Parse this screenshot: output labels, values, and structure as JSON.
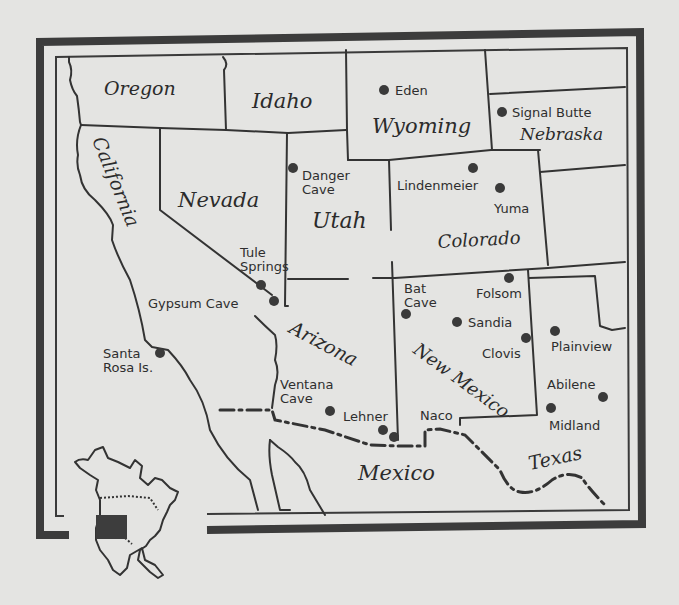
{
  "map": {
    "title": "",
    "states": [
      {
        "name": "Oregon",
        "x": 104,
        "y": 95,
        "size": 19,
        "rotate": 0
      },
      {
        "name": "Idaho",
        "x": 252,
        "y": 108,
        "size": 21,
        "rotate": 0
      },
      {
        "name": "Wyoming",
        "x": 372,
        "y": 133,
        "size": 21,
        "rotate": 0
      },
      {
        "name": "Nebraska",
        "x": 520,
        "y": 140,
        "size": 17,
        "rotate": 0
      },
      {
        "name": "California",
        "x": 92,
        "y": 140,
        "size": 19,
        "rotate": 68
      },
      {
        "name": "Nevada",
        "x": 178,
        "y": 207,
        "size": 21,
        "rotate": 0
      },
      {
        "name": "Utah",
        "x": 312,
        "y": 228,
        "size": 22,
        "rotate": 0
      },
      {
        "name": "Colorado",
        "x": 438,
        "y": 248,
        "size": 18,
        "rotate": -3
      },
      {
        "name": "Arizona",
        "x": 288,
        "y": 332,
        "size": 19,
        "rotate": 28
      },
      {
        "name": "New Mexico",
        "x": 412,
        "y": 352,
        "size": 18,
        "rotate": 36
      },
      {
        "name": "Mexico",
        "x": 358,
        "y": 480,
        "size": 21,
        "rotate": 0
      },
      {
        "name": "Texas",
        "x": 530,
        "y": 470,
        "size": 19,
        "rotate": -12
      }
    ],
    "sites": [
      {
        "name": "Eden",
        "dot": [
          384,
          90
        ],
        "label_lines": [
          "Eden"
        ],
        "lx": 395,
        "ly": 95
      },
      {
        "name": "Signal Butte",
        "dot": [
          502,
          112
        ],
        "label_lines": [
          "Signal Butte"
        ],
        "lx": 512,
        "ly": 117
      },
      {
        "name": "Danger Cave",
        "dot": [
          293,
          168
        ],
        "label_lines": [
          "Danger",
          "Cave"
        ],
        "lx": 302,
        "ly": 180
      },
      {
        "name": "Lindenmeier",
        "dot": [
          473,
          168
        ],
        "label_lines": [
          "Lindenmeier"
        ],
        "lx": 397,
        "ly": 190
      },
      {
        "name": "Yuma",
        "dot": [
          500,
          188
        ],
        "label_lines": [
          "Yuma"
        ],
        "lx": 494,
        "ly": 213
      },
      {
        "name": "Tule Springs",
        "dot": [
          261,
          285
        ],
        "label_lines": [
          "Tule",
          "Springs"
        ],
        "lx": 240,
        "ly": 257
      },
      {
        "name": "Gypsum Cave",
        "dot": [
          274,
          301
        ],
        "label_lines": [
          "Gypsum Cave"
        ],
        "lx": 148,
        "ly": 308
      },
      {
        "name": "Santa Rosa Is.",
        "dot": [
          160,
          353
        ],
        "label_lines": [
          "Santa",
          "Rosa Is."
        ],
        "lx": 103,
        "ly": 358
      },
      {
        "name": "Bat Cave",
        "dot": [
          406,
          314
        ],
        "label_lines": [
          "Bat",
          "Cave"
        ],
        "lx": 404,
        "ly": 293
      },
      {
        "name": "Folsom",
        "dot": [
          509,
          278
        ],
        "label_lines": [
          "Folsom"
        ],
        "lx": 476,
        "ly": 298
      },
      {
        "name": "Sandia",
        "dot": [
          457,
          322
        ],
        "label_lines": [
          "Sandia"
        ],
        "lx": 468,
        "ly": 327
      },
      {
        "name": "Clovis",
        "dot": [
          526,
          338
        ],
        "label_lines": [
          "Clovis"
        ],
        "lx": 482,
        "ly": 358
      },
      {
        "name": "Plainview",
        "dot": [
          555,
          331
        ],
        "label_lines": [
          "Plainview"
        ],
        "lx": 551,
        "ly": 351
      },
      {
        "name": "Abilene",
        "dot": [
          603,
          397
        ],
        "label_lines": [
          "Abilene"
        ],
        "lx": 547,
        "ly": 389
      },
      {
        "name": "Midland",
        "dot": [
          551,
          408
        ],
        "label_lines": [
          "Midland"
        ],
        "lx": 549,
        "ly": 430
      },
      {
        "name": "Ventana Cave",
        "dot": [
          330,
          411
        ],
        "label_lines": [
          "Ventana",
          "Cave"
        ],
        "lx": 280,
        "ly": 389
      },
      {
        "name": "Lehner",
        "dot": [
          383,
          430
        ],
        "label_lines": [
          "Lehner"
        ],
        "lx": 343,
        "ly": 421
      },
      {
        "name": "Naco",
        "dot": [
          394,
          437
        ],
        "label_lines": [
          "Naco"
        ],
        "lx": 420,
        "ly": 420
      }
    ],
    "inset": {
      "description": "North America locator map with study area highlighted",
      "highlight_color": "#3d3d3d"
    }
  },
  "colors": {
    "paper": "#e4e4e2",
    "ink": "#333333",
    "frame": "#3c3c3c"
  }
}
